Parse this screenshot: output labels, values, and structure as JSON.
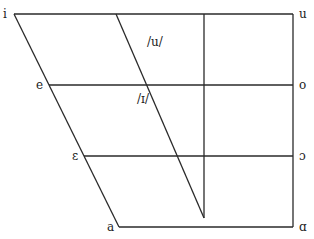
{
  "diagram": {
    "type": "vowel-quadrilateral",
    "line_color": "#2a2a2a",
    "vowels": {
      "front": [
        "i",
        "e",
        "ε",
        "a"
      ],
      "back": [
        "u",
        "o",
        "ɔ",
        "ɑ"
      ]
    },
    "labels": {
      "i": "i",
      "e": "e",
      "epsilon": "ε",
      "a": "a",
      "u": "u",
      "o": "o",
      "open_o": "ɔ",
      "script_a": "ɑ",
      "phoneme_u": "/u/",
      "phoneme_small_i": "/ɪ/"
    }
  }
}
